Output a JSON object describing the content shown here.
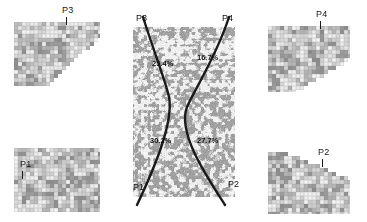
{
  "figure": {
    "name": "transect-crossing-figure",
    "background_color": "#ffffff",
    "line_color": "#1a1a1a",
    "text_color": "#111111"
  },
  "center_panel": {
    "name": "central-texture-panel",
    "description": "grayscale speckled texture panel",
    "x": 133,
    "y": 27,
    "width": 102,
    "height": 170,
    "endpoint_labels": [
      {
        "id": "p3",
        "label": "P3",
        "position": "top-left"
      },
      {
        "id": "p4",
        "label": "P4",
        "position": "top-right"
      },
      {
        "id": "p1",
        "label": "P1",
        "position": "bottom-left"
      },
      {
        "id": "p2",
        "label": "P2",
        "position": "bottom-right"
      }
    ],
    "percentages": [
      {
        "id": "pct-top-left",
        "value": "25.4%",
        "transect": "P3-P1",
        "quadrant": "upper-left"
      },
      {
        "id": "pct-top-right",
        "value": "16.7%",
        "transect": "P4-P2",
        "quadrant": "upper-right"
      },
      {
        "id": "pct-bottom-left",
        "value": "30.2%",
        "transect": "P3-P1",
        "quadrant": "lower-left"
      },
      {
        "id": "pct-bottom-right",
        "value": "27.7%",
        "transect": "P4-P2",
        "quadrant": "lower-right"
      }
    ],
    "transects": [
      {
        "id": "transect-p3-p1",
        "from": "P3",
        "to": "P1"
      },
      {
        "id": "transect-p4-p2",
        "from": "P4",
        "to": "P2"
      }
    ]
  },
  "thumbnails": [
    {
      "id": "thumb-tl",
      "label": "P3",
      "corner": "top-left"
    },
    {
      "id": "thumb-tr",
      "label": "P4",
      "corner": "top-right"
    },
    {
      "id": "thumb-bl",
      "label": "P1",
      "corner": "bottom-left"
    },
    {
      "id": "thumb-br",
      "label": "P2",
      "corner": "bottom-right"
    }
  ],
  "chart_data": {
    "type": "scatter",
    "title": "",
    "xlabel": "",
    "ylabel": "",
    "categories": [
      "P3-P1 upper",
      "P4-P2 upper",
      "P3-P1 lower",
      "P4-P2 lower"
    ],
    "values": [
      25.4,
      16.7,
      30.2,
      27.7
    ],
    "annotations": [
      "25.4%",
      "16.7%",
      "30.2%",
      "27.7%"
    ],
    "legend": [
      "P1",
      "P2",
      "P3",
      "P4"
    ],
    "grid": false
  }
}
